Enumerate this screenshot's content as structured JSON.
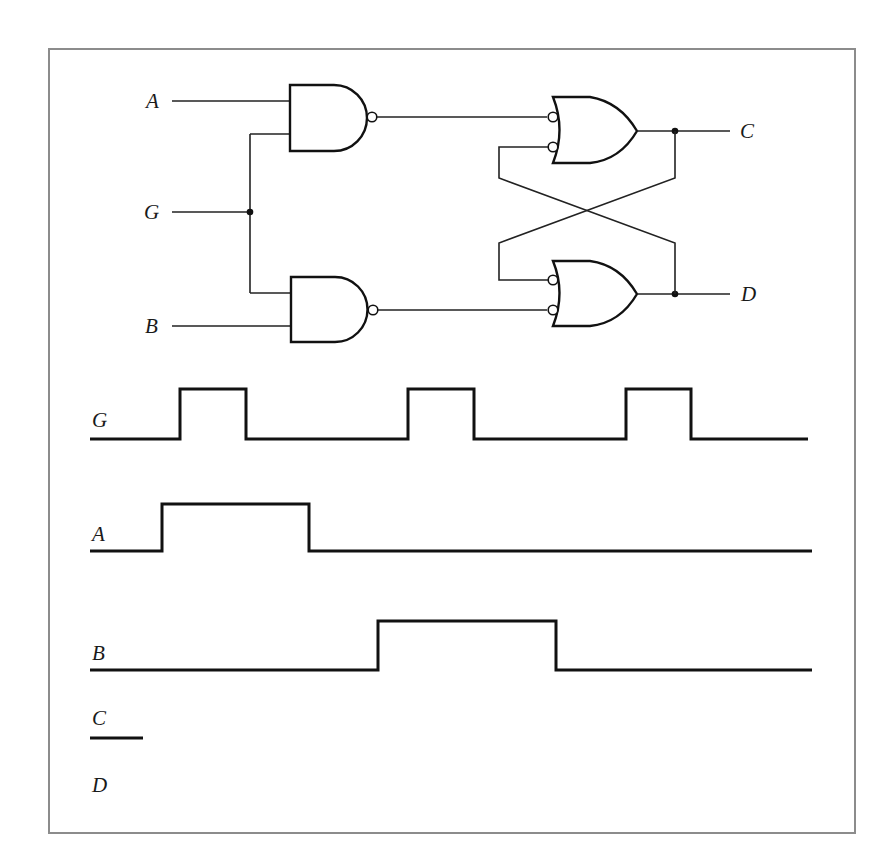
{
  "figure": {
    "circuit": {
      "inputs": [
        {
          "name": "A",
          "label": "A",
          "y": 101
        },
        {
          "name": "G",
          "label": "G",
          "y": 212
        },
        {
          "name": "B",
          "label": "B",
          "y": 326
        }
      ],
      "outputs": [
        {
          "name": "C",
          "label": "C",
          "y": 131
        },
        {
          "name": "D",
          "label": "D",
          "y": 294
        }
      ],
      "gates": [
        {
          "id": "nand-top",
          "type": "NAND",
          "inputs": [
            "A",
            "G"
          ]
        },
        {
          "id": "nand-bottom",
          "type": "NAND",
          "inputs": [
            "G",
            "B"
          ]
        },
        {
          "id": "or-top",
          "type": "OR (inverted inputs)",
          "inputs": [
            "nand-top",
            "D"
          ],
          "output": "C"
        },
        {
          "id": "or-bottom",
          "type": "OR (inverted inputs)",
          "inputs": [
            "C",
            "nand-bottom"
          ],
          "output": "D"
        }
      ]
    },
    "timing": {
      "signals": [
        {
          "name": "G",
          "label": "G",
          "low_y": 439,
          "high_y": 389,
          "start_x": 90,
          "end_x": 808,
          "transitions": [
            180,
            246,
            408,
            474,
            626,
            691
          ],
          "initial": "low"
        },
        {
          "name": "A",
          "label": "A",
          "low_y": 551,
          "high_y": 504,
          "start_x": 90,
          "end_x": 812,
          "transitions": [
            162,
            309
          ],
          "initial": "low"
        },
        {
          "name": "B",
          "label": "B",
          "low_y": 670,
          "high_y": 621,
          "start_x": 90,
          "end_x": 812,
          "transitions": [
            378,
            556
          ],
          "initial": "low"
        },
        {
          "name": "C",
          "label": "C",
          "low_y": 738,
          "high_y": 738,
          "start_x": 90,
          "end_x": 143,
          "transitions": [],
          "initial": "partial"
        },
        {
          "name": "D",
          "label": "D",
          "low_y": null,
          "high_y": null,
          "start_x": null,
          "end_x": null,
          "transitions": [],
          "initial": "blank"
        }
      ]
    }
  }
}
